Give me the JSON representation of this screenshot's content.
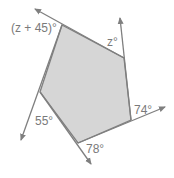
{
  "diagram": {
    "type": "pentagon-exterior-angles",
    "fill_color": "#d6d6d6",
    "line_color": "#7f7f7f",
    "labels": {
      "top_left": "(z + 45)°",
      "top_right": "z°",
      "bottom_right": "74°",
      "bottom": "78°",
      "left": "55°"
    }
  }
}
